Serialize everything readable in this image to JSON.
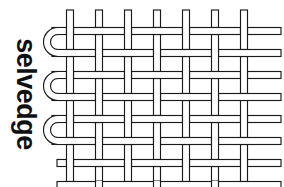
{
  "figure": {
    "title": "selvedge",
    "kind": "plain-weave textile diagram",
    "label_text": "selvedge",
    "label_rotation_deg": 90,
    "canvas": {
      "width": 284,
      "height": 187
    },
    "colors": {
      "background": "#ffffff",
      "thread_outline": "#1a1a1a",
      "thread_fill": "#ffffff",
      "label_text": "#101010"
    },
    "geometry": {
      "stroke_width": 1.15,
      "thread_ribbon_width": 7,
      "warp_count": 7,
      "warp_x": [
        70,
        99,
        128,
        157,
        186,
        215,
        244
      ],
      "warp_top_y": 10,
      "warp_bottom_y": 181,
      "weft_count": 8,
      "weft_y": [
        31,
        53,
        75,
        97,
        119,
        141,
        163,
        185
      ],
      "weft_left_x": 57,
      "weft_right_x": 281,
      "selvedge_loop_count": 3,
      "selvedge_loop_pairs": [
        [
          0,
          1
        ],
        [
          2,
          3
        ],
        [
          4,
          5
        ]
      ],
      "selvedge_loop_left_x": 52,
      "selvedge_turn_radius": 11
    }
  },
  "legend": {
    "warp_label": "warp",
    "weft_label": "weft",
    "selvedge_label": "selvedge"
  }
}
